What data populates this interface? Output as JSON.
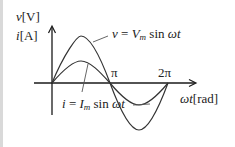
{
  "diagram": {
    "y_axis_labels": {
      "voltage": "v[V]",
      "current": "i[A]"
    },
    "x_axis_label": "ωt[rad]",
    "tick_labels": [
      "π",
      "2π"
    ],
    "curves": [
      {
        "name": "voltage",
        "equation": "v = V_m sin ωt",
        "amplitude_px": 47
      },
      {
        "name": "current",
        "equation": "i = I_m sin ωt",
        "amplitude_px": 22
      }
    ],
    "colors": {
      "line": "#333333",
      "axis": "#1a1a1a",
      "background": "#ffffff"
    }
  },
  "labels": {
    "v_var": "v",
    "v_unit": "[V]",
    "i_var": "i",
    "i_unit": "[A]",
    "v_eq_lhs": "v",
    "v_eq_eq": " = ",
    "v_eq_V": "V",
    "v_eq_sub": "m",
    "v_eq_sin": " sin ",
    "v_eq_wt": "ωt",
    "i_eq_lhs": "i",
    "i_eq_eq": " = ",
    "i_eq_I": "I",
    "i_eq_sub": "m",
    "i_eq_sin": " sin ",
    "i_eq_wt": "ωt",
    "pi": "π",
    "two_pi": "2π",
    "x_var": "ωt",
    "x_unit": "[rad]"
  }
}
